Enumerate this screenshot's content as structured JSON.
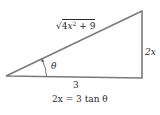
{
  "diagram": {
    "type": "right-triangle",
    "labels": {
      "hypotenuse": {
        "radical": "√",
        "radicand_prefix": "4",
        "radicand_var": "x",
        "radicand_exp": "2",
        "radicand_suffix": " + 9"
      },
      "opposite": "2x",
      "adjacent": "3",
      "angle": "θ"
    },
    "equation": "2x = 3 tan θ",
    "colors": {
      "stroke": "#7a7a7a",
      "text": "#2a2a2a",
      "background": "#ffffff"
    }
  }
}
